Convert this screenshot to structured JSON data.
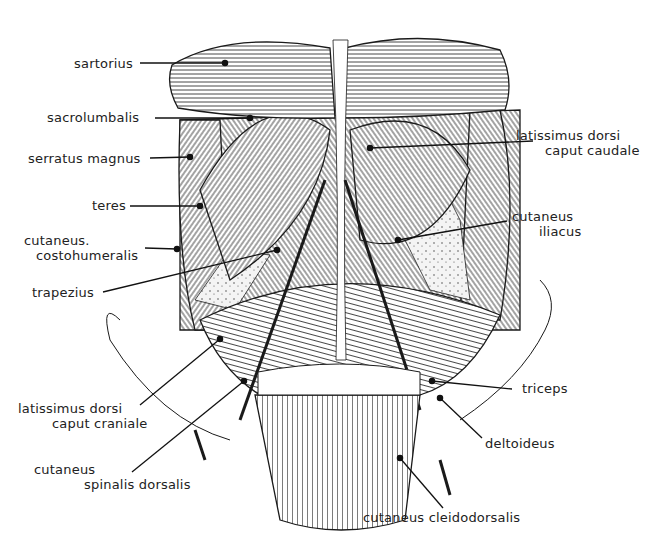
{
  "figure": {
    "background": "#ffffff",
    "ink": "#1a1a1a"
  },
  "labels": {
    "sartorius": {
      "line1": "sartorius"
    },
    "sacrolumbalis": {
      "line1": "sacrolumbalis"
    },
    "serratus_magnus": {
      "line1": "serratus magnus"
    },
    "teres": {
      "line1": "teres"
    },
    "cutaneus_costohumeralis": {
      "line1": "cutaneus.",
      "line2": "costohumeralis"
    },
    "trapezius": {
      "line1": "trapezius"
    },
    "latissimus_dorsi_caput_craniale": {
      "line1": "latissimus dorsi",
      "line2": "caput craniale"
    },
    "cutaneus_spinalis_dorsalis": {
      "line1": "cutaneus",
      "line2": "spinalis dorsalis"
    },
    "latissimus_dorsi_caput_caudale": {
      "line1": "latissimus dorsi",
      "line2": "caput caudale"
    },
    "cutaneus_iliacus": {
      "line1": "cutaneus",
      "line2": "iliacus"
    },
    "triceps": {
      "line1": "triceps"
    },
    "deltoideus": {
      "line1": "deltoideus"
    },
    "cutaneus_cleidodorsalis": {
      "line1": "cutaneus cleidodorsalis"
    }
  }
}
